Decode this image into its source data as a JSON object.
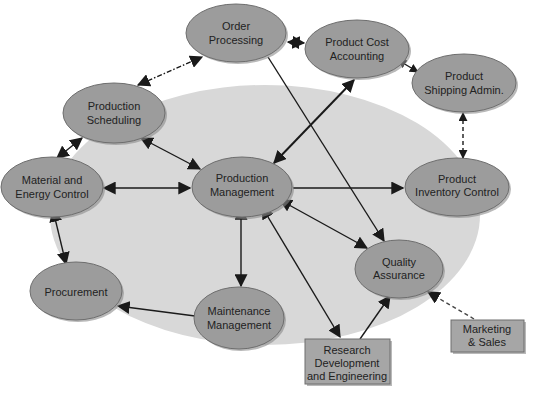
{
  "diagram": {
    "title": "",
    "background_ellipse": {
      "cx": 265,
      "cy": 215,
      "rx": 215,
      "ry": 130,
      "color": "#d8d8d8"
    },
    "colors": {
      "node_fill": "#9c9c9c",
      "node_stroke": "#6e6e6e",
      "arrow": "#1a1a1a",
      "text": "#222222"
    },
    "nodes": [
      {
        "id": "order_processing",
        "shape": "ellipse",
        "cx": 236,
        "cy": 33,
        "rx": 50,
        "ry": 29,
        "lines": [
          "Order",
          "Processing"
        ]
      },
      {
        "id": "product_cost_accounting",
        "shape": "ellipse",
        "cx": 357,
        "cy": 49,
        "rx": 52,
        "ry": 29,
        "lines": [
          "Product Cost",
          "Accounting"
        ]
      },
      {
        "id": "product_shipping_admin",
        "shape": "ellipse",
        "cx": 464,
        "cy": 83,
        "rx": 52,
        "ry": 29,
        "lines": [
          "Product",
          "Shipping Admin."
        ]
      },
      {
        "id": "production_scheduling",
        "shape": "ellipse",
        "cx": 114,
        "cy": 113,
        "rx": 51,
        "ry": 30,
        "lines": [
          "Production",
          "Scheduling"
        ]
      },
      {
        "id": "material_energy_control",
        "shape": "ellipse",
        "cx": 52,
        "cy": 187,
        "rx": 51,
        "ry": 30,
        "lines": [
          "Material and",
          "Energy Control"
        ]
      },
      {
        "id": "production_management",
        "shape": "ellipse",
        "cx": 242,
        "cy": 187,
        "rx": 50,
        "ry": 30,
        "lines": [
          "Production",
          "Management"
        ]
      },
      {
        "id": "product_inventory_control",
        "shape": "ellipse",
        "cx": 457,
        "cy": 187,
        "rx": 52,
        "ry": 29,
        "lines": [
          "Product",
          "Inventory Control"
        ]
      },
      {
        "id": "quality_assurance",
        "shape": "ellipse",
        "cx": 399,
        "cy": 269,
        "rx": 44,
        "ry": 29,
        "lines": [
          "Quality",
          "Assurance"
        ]
      },
      {
        "id": "procurement",
        "shape": "ellipse",
        "cx": 76,
        "cy": 291,
        "rx": 46,
        "ry": 29,
        "lines": [
          "Procurement"
        ]
      },
      {
        "id": "maintenance_management",
        "shape": "ellipse",
        "cx": 239,
        "cy": 318,
        "rx": 45,
        "ry": 31,
        "lines": [
          "Maintenance",
          "Management"
        ]
      },
      {
        "id": "research_development_engineering",
        "shape": "rect",
        "x": 305,
        "y": 339,
        "w": 85,
        "h": 45,
        "lines": [
          "Research",
          "Development",
          "and Engineering"
        ]
      },
      {
        "id": "marketing_sales",
        "shape": "rect",
        "x": 451,
        "y": 320,
        "w": 73,
        "h": 32,
        "lines": [
          "Marketing",
          "& Sales"
        ]
      }
    ],
    "edges": [
      {
        "from": "order_processing",
        "to": "product_cost_accounting",
        "style": "solid",
        "direction": "both"
      },
      {
        "from": "production_scheduling",
        "to": "order_processing",
        "style": "dashdot",
        "direction": "both"
      },
      {
        "from": "product_cost_accounting",
        "to": "product_shipping_admin",
        "style": "solid",
        "direction": "both"
      },
      {
        "from": "product_shipping_admin",
        "to": "product_inventory_control",
        "style": "dashed",
        "direction": "both"
      },
      {
        "from": "product_cost_accounting",
        "to": "production_management",
        "style": "solid",
        "direction": "both"
      },
      {
        "from": "order_processing",
        "to": "quality_assurance",
        "style": "solid",
        "direction": "forward"
      },
      {
        "from": "production_scheduling",
        "to": "material_energy_control",
        "style": "solid",
        "direction": "both"
      },
      {
        "from": "production_scheduling",
        "to": "production_management",
        "style": "solid",
        "direction": "both"
      },
      {
        "from": "material_energy_control",
        "to": "production_management",
        "style": "solid",
        "direction": "both"
      },
      {
        "from": "production_management",
        "to": "product_inventory_control",
        "style": "solid",
        "direction": "forward"
      },
      {
        "from": "production_management",
        "to": "quality_assurance",
        "style": "solid",
        "direction": "both"
      },
      {
        "from": "production_management",
        "to": "maintenance_management",
        "style": "solid",
        "direction": "both"
      },
      {
        "from": "production_management",
        "to": "research_development_engineering",
        "style": "solid",
        "direction": "both"
      },
      {
        "from": "material_energy_control",
        "to": "procurement",
        "style": "solid",
        "direction": "both"
      },
      {
        "from": "maintenance_management",
        "to": "procurement",
        "style": "solid",
        "direction": "forward"
      },
      {
        "from": "research_development_engineering",
        "to": "quality_assurance",
        "style": "solid",
        "direction": "forward"
      },
      {
        "from": "marketing_sales",
        "to": "quality_assurance",
        "style": "dashed",
        "direction": "forward"
      }
    ]
  },
  "labels": {
    "order_processing": [
      "Order",
      "Processing"
    ],
    "product_cost_accounting": [
      "Product Cost",
      "Accounting"
    ],
    "product_shipping_admin": [
      "Product",
      "Shipping Admin."
    ],
    "production_scheduling": [
      "Production",
      "Scheduling"
    ],
    "material_energy_control": [
      "Material and",
      "Energy Control"
    ],
    "production_management": [
      "Production",
      "Management"
    ],
    "product_inventory_control": [
      "Product",
      "Inventory Control"
    ],
    "quality_assurance": [
      "Quality",
      "Assurance"
    ],
    "procurement": [
      "Procurement"
    ],
    "maintenance_management": [
      "Maintenance",
      "Management"
    ],
    "research_development_engineering": [
      "Research",
      "Development",
      "and Engineering"
    ],
    "marketing_sales": [
      "Marketing",
      "& Sales"
    ]
  }
}
